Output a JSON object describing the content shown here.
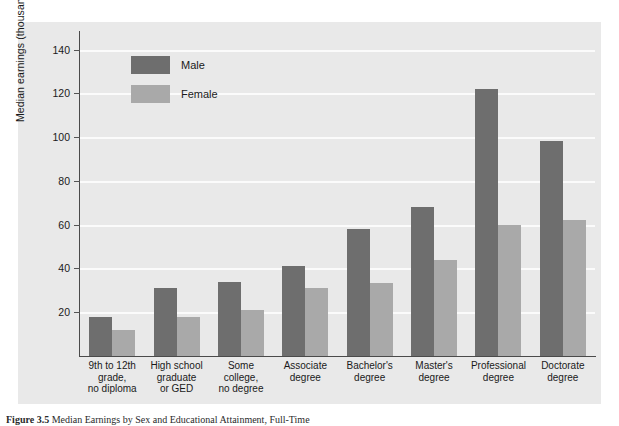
{
  "chart_data": {
    "type": "bar",
    "title": "",
    "xlabel": "",
    "ylabel": "Median earnings (thousands of dollars)",
    "ylim": [
      0,
      148
    ],
    "yticks": [
      20,
      40,
      60,
      80,
      100,
      120,
      140
    ],
    "grid": true,
    "legend_position": "inside-top-left",
    "categories": [
      "9th to 12th grade, no diploma",
      "High school graduate or GED",
      "Some college, no degree",
      "Associate degree",
      "Bachelor's degree",
      "Master's degree",
      "Professional degree",
      "Doctorate degree"
    ],
    "category_lines": [
      [
        "9th to 12th",
        "grade,",
        "no diploma"
      ],
      [
        "High school",
        "graduate",
        "or GED"
      ],
      [
        "Some",
        "college,",
        "no degree"
      ],
      [
        "Associate",
        "degree"
      ],
      [
        "Bachelor's",
        "degree"
      ],
      [
        "Master's",
        "degree"
      ],
      [
        "Professional",
        "degree"
      ],
      [
        "Doctorate",
        "degree"
      ]
    ],
    "series": [
      {
        "name": "Male",
        "color": "#6e6e6e",
        "values": [
          18,
          31,
          34,
          41,
          58,
          68,
          122,
          98
        ]
      },
      {
        "name": "Female",
        "color": "#a9a9a9",
        "values": [
          12,
          18,
          21,
          31,
          33.5,
          44,
          60,
          62
        ]
      }
    ]
  },
  "legend": {
    "items": [
      {
        "label": "Male",
        "color": "#6e6e6e"
      },
      {
        "label": "Female",
        "color": "#a9a9a9"
      }
    ]
  },
  "caption": {
    "figure_number": "Figure 3.5",
    "text": "Median Earnings by Sex and Educational Attainment, Full-Time"
  },
  "colors": {
    "panel_background": "#e9e9e9",
    "gridline": "#fbfbfb",
    "axis": "#4a4a4a",
    "text": "#1a1a1a"
  }
}
